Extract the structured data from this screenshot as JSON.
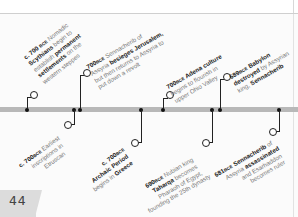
{
  "page": {
    "number": "44"
  },
  "timeline": {
    "events_above": [
      {
        "date": "c. 700",
        "era": "BCE",
        "lines": [
          "Nomadic",
          "Scythians begin to",
          "establish permanent",
          "settlements on the",
          "western steppes"
        ],
        "bold": [
          "Scythians",
          "permanent",
          "settlements"
        ]
      },
      {
        "date": "700",
        "era": "BCE",
        "lines": [
          "Sennacherib of",
          "Assyria besieges Jerusalem,",
          "but then returns to Assyria to",
          "put down a revolt"
        ],
        "bold": [
          "besieges Jerusalem,"
        ]
      },
      {
        "date": "700",
        "era": "BCE",
        "lines": [
          "Adena culture",
          "begins to flourish in",
          "upper Ohio Valley"
        ],
        "bold": [
          "Adena culture"
        ]
      },
      {
        "date": "689",
        "era": "BCE",
        "lines": [
          "Babylon",
          "destroyed by Assyrian",
          "king, Sennacherib"
        ],
        "bold": [
          "Babylon",
          "destroyed",
          "Sennacherib"
        ]
      }
    ],
    "events_below": [
      {
        "date": "c. 700",
        "era": "BCE",
        "lines": [
          "Earliest",
          "inscriptions in",
          "Etruscan"
        ],
        "bold": [
          "inscriptions"
        ]
      },
      {
        "date": "c. 700",
        "era": "BCE",
        "lines": [
          "",
          "Archaic Period",
          "begins in Greece"
        ],
        "bold": [
          "Archaic Period",
          "Greece"
        ]
      },
      {
        "date": "690",
        "era": "BCE",
        "lines": [
          "Nubian king",
          "Taharqa becomes",
          "Pharaoh of Egypt,",
          "founding the 25th dynasty"
        ],
        "bold": [
          "Taharqa"
        ]
      },
      {
        "date": "681",
        "era": "BCE",
        "lines": [
          "Sennacherib of",
          "Assyria assassinated",
          "and Esarhaddon",
          "becomes ruler"
        ],
        "bold": [
          "Sennacherib",
          "assassinated"
        ]
      }
    ]
  },
  "text": {
    "e1_date": "c. 700",
    "e1_era": "BCE",
    "e1_t1": " Nomadic",
    "e1_b1": "Scythians",
    "e1_t2": " begin to",
    "e1_t3": "establish ",
    "e1_b2": "permanent",
    "e1_b3": "settlements",
    "e1_t4": " on the",
    "e1_t5": "western steppes",
    "e2_date": "700",
    "e2_era": "BCE",
    "e2_t1": " Sennacherib of",
    "e2_t2": "Assyria ",
    "e2_b1": "besieges Jerusalem,",
    "e2_t3": "but then returns to Assyria to",
    "e2_t4": "put down a revolt",
    "e3_date": "700",
    "e3_era": "BCE",
    "e3_b1": " Adena culture",
    "e3_t1": "begins to flourish in",
    "e3_t2": "upper Ohio Valley",
    "e4_date": "689",
    "e4_era": "BCE",
    "e4_b1": " Babylon",
    "e4_b2": "destroyed",
    "e4_t1": " by Assyrian",
    "e4_t2": "king, ",
    "e4_b3": "Sennacherib",
    "e5_date": "c. 700",
    "e5_era": "BCE",
    "e5_t1": " Earliest",
    "e5_b1": "inscriptions",
    "e5_t2": " in",
    "e5_t3": "Etruscan",
    "e6_date": "c. 700",
    "e6_era": "BCE",
    "e6_b1": "Archaic Period",
    "e6_t1": "begins in ",
    "e6_b2": "Greece",
    "e7_date": "690",
    "e7_era": "BCE",
    "e7_t1": " Nubian king",
    "e7_b1": "Taharqa",
    "e7_t2": " becomes",
    "e7_t3": "Pharaoh of Egypt,",
    "e7_t4": "founding the 25th dynasty",
    "e8_date": "681",
    "e8_era": "BCE",
    "e8_b1": " Sennacherib",
    "e8_t1": " of",
    "e8_t2": "Assyria ",
    "e8_b2": "assassinated",
    "e8_t3": "and Esarhaddon",
    "e8_t4": "becomes ruler"
  }
}
